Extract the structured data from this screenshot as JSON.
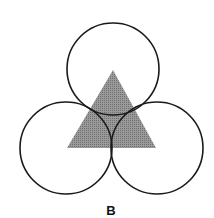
{
  "figure": {
    "label": "B",
    "triangle": {
      "points": "113,70 67,148 156,148",
      "fill": "#8c8c8c"
    },
    "circles": [
      {
        "name": "top-circle",
        "cx": 113,
        "cy": 69,
        "r": 46
      },
      {
        "name": "left-circle",
        "cx": 66,
        "cy": 148,
        "r": 46
      },
      {
        "name": "right-circle",
        "cx": 157,
        "cy": 148,
        "r": 46
      }
    ],
    "stroke": "#1a1a1a"
  }
}
